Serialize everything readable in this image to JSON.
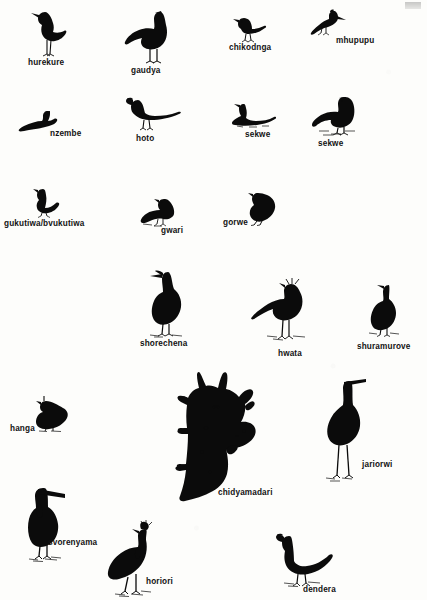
{
  "page": {
    "background_color": "#fdfdfb",
    "ink_color": "#0b0b0b",
    "width": 427,
    "height": 600,
    "corner_mark": "",
    "edge_mark": ""
  },
  "figures": [
    {
      "id": "hurekure",
      "label": "hurekure",
      "icon": "wattled-jacana-silhouette",
      "row": 1,
      "label_x": 28,
      "label_y": 59,
      "fig_x": 30,
      "fig_y": 8,
      "fig_w": 44,
      "fig_h": 48
    },
    {
      "id": "gaudya",
      "label": "gaudya",
      "icon": "spur-winged-goose-silhouette",
      "row": 1,
      "label_x": 131,
      "label_y": 67,
      "fig_x": 124,
      "fig_y": 10,
      "fig_w": 50,
      "fig_h": 52
    },
    {
      "id": "chikodnga",
      "label": "chikodnga",
      "icon": "small-perching-bird-silhouette",
      "row": 1,
      "label_x": 229,
      "label_y": 44,
      "fig_x": 232,
      "fig_y": 16,
      "fig_w": 36,
      "fig_h": 26
    },
    {
      "id": "mhupupu",
      "label": "mhupupu",
      "icon": "hoopoe-silhouette",
      "row": 1,
      "label_x": 336,
      "label_y": 37,
      "fig_x": 310,
      "fig_y": 10,
      "fig_w": 34,
      "fig_h": 26
    },
    {
      "id": "nzembe",
      "label": "nzembe",
      "icon": "swimming-duck-silhouette",
      "row": 2,
      "label_x": 50,
      "label_y": 130,
      "fig_x": 18,
      "fig_y": 110,
      "fig_w": 38,
      "fig_h": 22
    },
    {
      "id": "hoto",
      "label": "hoto",
      "icon": "hornbill-silhouette",
      "row": 2,
      "label_x": 136,
      "label_y": 135,
      "fig_x": 126,
      "fig_y": 96,
      "fig_w": 54,
      "fig_h": 36
    },
    {
      "id": "sekwe-1",
      "label": "sekwe",
      "icon": "swimming-goose-silhouette",
      "row": 2,
      "label_x": 245,
      "label_y": 131,
      "fig_x": 231,
      "fig_y": 102,
      "fig_w": 44,
      "fig_h": 26
    },
    {
      "id": "sekwe-2",
      "label": "sekwe",
      "icon": "standing-goose-silhouette",
      "row": 2,
      "label_x": 318,
      "label_y": 140,
      "fig_x": 311,
      "fig_y": 96,
      "fig_w": 44,
      "fig_h": 40
    },
    {
      "id": "gukutiwa-bvukutiwa",
      "label": "gukutiwa/bvukutiwa",
      "icon": "dove-silhouette",
      "row": 3,
      "label_x": 4,
      "label_y": 220,
      "fig_x": 29,
      "fig_y": 188,
      "fig_w": 30,
      "fig_h": 28
    },
    {
      "id": "gwari",
      "label": "gwari",
      "icon": "francolin-silhouette",
      "row": 3,
      "label_x": 161,
      "label_y": 227,
      "fig_x": 140,
      "fig_y": 198,
      "fig_w": 34,
      "fig_h": 28
    },
    {
      "id": "gorwe",
      "label": "gorwe",
      "icon": "guineafowl-partridge-silhouette",
      "row": 3,
      "label_x": 223,
      "label_y": 219,
      "fig_x": 244,
      "fig_y": 192,
      "fig_w": 32,
      "fig_h": 32
    },
    {
      "id": "shorechena",
      "label": "shorechena",
      "icon": "grey-heron-silhouette",
      "row": 4,
      "label_x": 140,
      "label_y": 340,
      "fig_x": 148,
      "fig_y": 270,
      "fig_w": 44,
      "fig_h": 66
    },
    {
      "id": "hwata",
      "label": "hwata",
      "icon": "secretary-bird-silhouette",
      "row": 4,
      "label_x": 278,
      "label_y": 350,
      "fig_x": 251,
      "fig_y": 278,
      "fig_w": 62,
      "fig_h": 66
    },
    {
      "id": "shuramurove",
      "label": "shuramurove",
      "icon": "hamerkop-silhouette",
      "row": 4,
      "label_x": 357,
      "label_y": 343,
      "fig_x": 365,
      "fig_y": 283,
      "fig_w": 34,
      "fig_h": 52
    },
    {
      "id": "hanga",
      "label": "hanga",
      "icon": "helmeted-guineafowl-silhouette",
      "row": 5,
      "label_x": 10,
      "label_y": 425,
      "fig_x": 33,
      "fig_y": 396,
      "fig_w": 36,
      "fig_h": 34
    },
    {
      "id": "chidyamadari",
      "label": "chidyamadari",
      "icon": "giraffe-with-oxpeckers-silhouette",
      "row": 5,
      "label_x": 218,
      "label_y": 489,
      "fig_x": 166,
      "fig_y": 372,
      "fig_w": 94,
      "fig_h": 130
    },
    {
      "id": "jariorwi",
      "label": "jariorwi",
      "icon": "openbill-stork-silhouette",
      "row": 5,
      "label_x": 362,
      "label_y": 461,
      "fig_x": 322,
      "fig_y": 379,
      "fig_w": 46,
      "fig_h": 100
    },
    {
      "id": "svorenyama",
      "label": "svorenyama",
      "icon": "marabou-stork-silhouette",
      "row": 6,
      "label_x": 48,
      "label_y": 539,
      "fig_x": 25,
      "fig_y": 486,
      "fig_w": 44,
      "fig_h": 72
    },
    {
      "id": "horiori",
      "label": "horiori",
      "icon": "crowned-crane-silhouette",
      "row": 6,
      "label_x": 146,
      "label_y": 578,
      "fig_x": 105,
      "fig_y": 521,
      "fig_w": 48,
      "fig_h": 72
    },
    {
      "id": "dendera",
      "label": "dendera",
      "icon": "ground-hornbill-silhouette",
      "row": 6,
      "label_x": 303,
      "label_y": 586,
      "fig_x": 276,
      "fig_y": 533,
      "fig_w": 52,
      "fig_h": 50
    }
  ]
}
